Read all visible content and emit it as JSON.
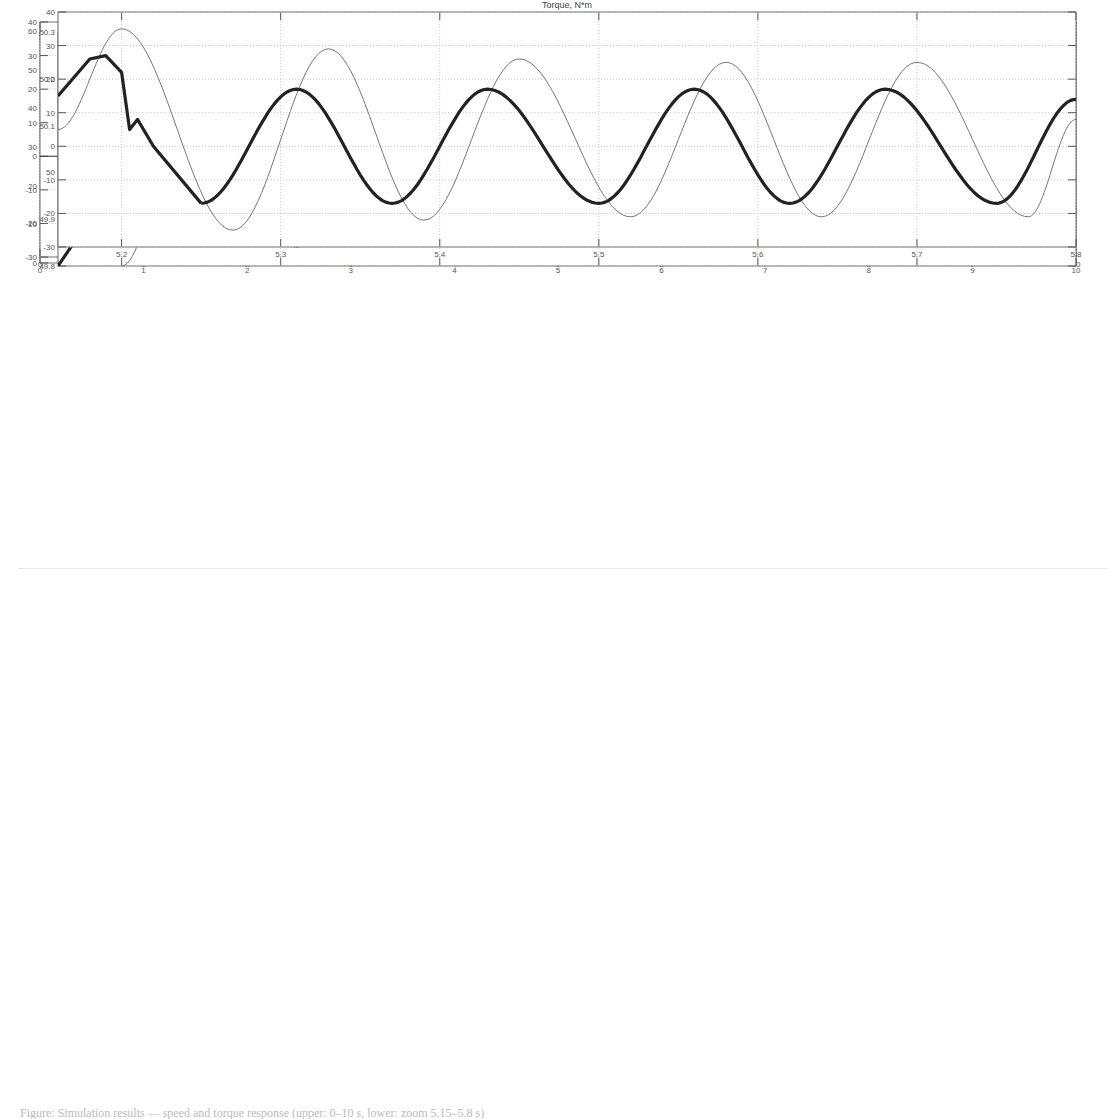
{
  "figure": {
    "caption": "Figure: Simulation results — speed and torque response (upper: 0–10 s, lower: zoom 5.15–5.8 s)"
  },
  "chart_data": [
    {
      "id": "speed_full",
      "type": "line",
      "title": "Speed, rad/sec",
      "xlabel": "",
      "ylabel": "",
      "xlim": [
        0,
        10
      ],
      "ylim": [
        0,
        60
      ],
      "xticks": [
        0,
        1,
        2,
        3,
        4,
        5,
        6,
        7,
        8,
        9,
        10
      ],
      "yticks": [
        0,
        10,
        20,
        30,
        40,
        50,
        60
      ],
      "grid": true,
      "series": [
        {
          "name": "speed",
          "x": [
            0.2,
            1,
            2,
            3,
            4,
            5.2,
            6,
            7,
            8,
            9,
            10
          ],
          "values": [
            0,
            8,
            18,
            28,
            38,
            50,
            50,
            50,
            50,
            50,
            50
          ]
        }
      ]
    },
    {
      "id": "torque_full",
      "type": "line",
      "title": "Torque, N*m",
      "xlabel": "",
      "ylabel": "",
      "xlim": [
        0,
        10
      ],
      "ylim": [
        -30,
        40
      ],
      "xticks": [
        0,
        1,
        2,
        3,
        4,
        5,
        6,
        7,
        8,
        9,
        10
      ],
      "yticks": [
        -30,
        -20,
        -10,
        0,
        10,
        20,
        30,
        40
      ],
      "grid": true,
      "annotations": [
        "step to ~13 at t=0.2",
        "oscillation amplitude grows to ~35 near t=5.2",
        "steady oscillation between ~-20 and ~25 after t=5.25"
      ],
      "series": [
        {
          "name": "torque",
          "segments": [
            {
              "t": [
                0,
                0.2
              ],
              "value": 0
            },
            {
              "t": [
                0.2,
                5.2
              ],
              "peak_max": [
                26,
                35
              ],
              "peak_min": [
                -6,
                -6
              ],
              "note": "chirp oscillation, frequency increasing"
            },
            {
              "t": [
                5.2,
                10
              ],
              "peak_max": 25,
              "peak_min": -20,
              "min_spike": -24
            }
          ]
        }
      ]
    },
    {
      "id": "speed_zoom",
      "type": "line",
      "title": "Speed, rad/sec",
      "xlabel": "",
      "ylabel": "",
      "xlim": [
        5.16,
        5.8
      ],
      "ylim": [
        49.8,
        50.3
      ],
      "xticks": [
        5.2,
        5.3,
        5.4,
        5.5,
        5.6,
        5.7,
        5.8
      ],
      "yticks_labels": [
        "49.8",
        "49.9",
        "50",
        "50.1",
        "50.2",
        "50.3"
      ],
      "yticks": [
        49.8,
        49.9,
        50,
        50.1,
        50.2,
        50.3
      ],
      "grid": true,
      "series": [
        {
          "name": "thick",
          "style": "thick",
          "x": [
            5.16,
            5.2,
            5.21,
            5.24,
            5.3,
            5.36,
            5.42,
            5.48,
            5.54,
            5.6,
            5.66,
            5.72,
            5.78,
            5.8
          ],
          "values": [
            49.8,
            50.0,
            50.02,
            50.04,
            49.97,
            50.04,
            49.97,
            50.04,
            49.97,
            50.04,
            49.97,
            50.04,
            49.97,
            49.97
          ]
        },
        {
          "name": "thin",
          "style": "thin",
          "x": [
            5.2,
            5.25,
            5.31,
            5.37,
            5.43,
            5.5,
            5.56,
            5.62,
            5.68,
            5.74,
            5.8
          ],
          "values": [
            49.8,
            50.27,
            49.84,
            50.22,
            49.88,
            50.2,
            49.9,
            50.2,
            49.9,
            50.2,
            49.9
          ]
        }
      ]
    },
    {
      "id": "torque_zoom",
      "type": "line",
      "title": "Torque, N*m",
      "xlabel": "",
      "ylabel": "",
      "xlim": [
        5.16,
        5.8
      ],
      "ylim": [
        -30,
        40
      ],
      "xticks": [
        5.2,
        5.3,
        5.4,
        5.5,
        5.6,
        5.7,
        5.8
      ],
      "yticks": [
        -30,
        -20,
        -10,
        0,
        10,
        20,
        30,
        40
      ],
      "grid": true,
      "series": [
        {
          "name": "thick",
          "style": "thick",
          "x": [
            5.16,
            5.18,
            5.19,
            5.2,
            5.205,
            5.21,
            5.22,
            5.25,
            5.31,
            5.37,
            5.43,
            5.5,
            5.56,
            5.62,
            5.68,
            5.75,
            5.8
          ],
          "values": [
            15,
            26,
            27,
            22,
            5,
            8,
            0,
            -17,
            17,
            -17,
            17,
            -17,
            17,
            -17,
            17,
            -17,
            14
          ]
        },
        {
          "name": "thin",
          "style": "thin",
          "x": [
            5.16,
            5.2,
            5.27,
            5.33,
            5.39,
            5.45,
            5.52,
            5.58,
            5.64,
            5.7,
            5.77,
            5.8
          ],
          "values": [
            5,
            35,
            -25,
            29,
            -22,
            26,
            -21,
            25,
            -21,
            25,
            -21,
            8
          ]
        }
      ]
    }
  ]
}
